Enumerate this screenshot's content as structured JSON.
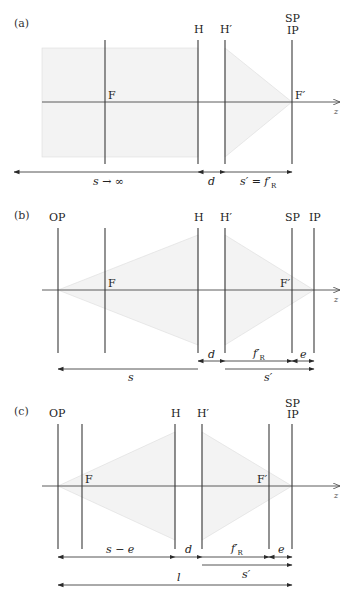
{
  "figure": {
    "panels": [
      {
        "id": "a",
        "label": "(a)",
        "axis_y": 102,
        "axis_label": "z",
        "planes": [
          {
            "name": "F",
            "x": 105,
            "label": "F",
            "label_pos": "axis"
          },
          {
            "name": "H",
            "x": 198,
            "label": "H",
            "label_pos": "top"
          },
          {
            "name": "H-prime",
            "x": 225,
            "label": "H′",
            "label_pos": "top"
          },
          {
            "name": "SP-IP",
            "x": 292,
            "label_top": "SP",
            "label_bottom": "IP",
            "label_pos": "top-stack",
            "focal_label": "F′"
          }
        ],
        "dimensions": [
          {
            "name": "s-infinity",
            "label": "s → ∞",
            "x1": 14,
            "x2": 198,
            "y": 172,
            "arrows": "left"
          },
          {
            "name": "d",
            "label": "d",
            "x1": 198,
            "x2": 225,
            "y": 172,
            "arrows": "both"
          },
          {
            "name": "s-prime-equals-fR",
            "label": "s′ = f′",
            "sub": "R",
            "x1": 225,
            "x2": 292,
            "y": 172,
            "arrows": "right"
          }
        ]
      },
      {
        "id": "b",
        "label": "(b)",
        "axis_y": 290,
        "axis_label": "z",
        "planes": [
          {
            "name": "OP",
            "x": 58,
            "label": "OP"
          },
          {
            "name": "F",
            "x": 105,
            "label": "F"
          },
          {
            "name": "H",
            "x": 198,
            "label": "H"
          },
          {
            "name": "H-prime",
            "x": 225,
            "label": "H′"
          },
          {
            "name": "SP",
            "x": 292,
            "label": "SP",
            "focal_label": "F′"
          },
          {
            "name": "IP",
            "x": 314,
            "label": "IP"
          }
        ],
        "dimensions": [
          {
            "name": "d",
            "label": "d",
            "x1": 198,
            "x2": 225,
            "y": 361
          },
          {
            "name": "fR-prime",
            "label": "f′",
            "sub": "R",
            "x1": 225,
            "x2": 292,
            "y": 361
          },
          {
            "name": "e",
            "label": "e",
            "x1": 292,
            "x2": 314,
            "y": 361
          },
          {
            "name": "s",
            "label": "s",
            "x1": 58,
            "x2": 198,
            "y": 369
          },
          {
            "name": "s-prime",
            "label": "s′",
            "x1": 225,
            "x2": 314,
            "y": 369
          }
        ]
      },
      {
        "id": "c",
        "label": "(c)",
        "axis_y": 486,
        "axis_label": "z",
        "planes": [
          {
            "name": "OP",
            "x": 58,
            "label": "OP"
          },
          {
            "name": "F",
            "x": 82,
            "label": "F"
          },
          {
            "name": "H",
            "x": 175,
            "label": "H"
          },
          {
            "name": "H-prime",
            "x": 202,
            "label": "H′"
          },
          {
            "name": "F-prime",
            "x": 269,
            "label": "F′"
          },
          {
            "name": "SP-IP",
            "x": 292,
            "label_top": "SP",
            "label_bottom": "IP"
          }
        ],
        "dimensions": [
          {
            "name": "s-minus-e",
            "label": "s − e",
            "x1": 58,
            "x2": 175,
            "y": 557
          },
          {
            "name": "d",
            "label": "d",
            "x1": 175,
            "x2": 202,
            "y": 557
          },
          {
            "name": "fR-prime",
            "label": "f′",
            "sub": "R",
            "x1": 202,
            "x2": 269,
            "y": 557
          },
          {
            "name": "e",
            "label": "e",
            "x1": 269,
            "x2": 292,
            "y": 557
          },
          {
            "name": "s-prime",
            "label": "s′",
            "x1": 202,
            "x2": 292,
            "y": 565
          },
          {
            "name": "l",
            "label": "l",
            "x1": 58,
            "x2": 292,
            "y": 585
          }
        ]
      }
    ],
    "colors": {
      "line": "#3a3a3a",
      "shade": "#f3f3f3",
      "shade_edge": "#dcdcdc",
      "text": "#222222"
    }
  }
}
